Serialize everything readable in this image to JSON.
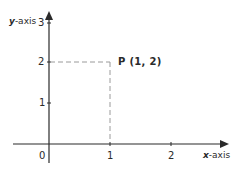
{
  "diagram": {
    "type": "coordinate-plane",
    "x_axis": {
      "var": "x",
      "suffix": "-axis",
      "ticks": [
        "0",
        "1",
        "2"
      ]
    },
    "y_axis": {
      "var": "y",
      "suffix": "-axis",
      "ticks": [
        "1",
        "2",
        "3"
      ]
    },
    "point": {
      "label": "P (1, 2)",
      "x": 1,
      "y": 2
    },
    "colors": {
      "axis": "#2a2a2a",
      "guide": "#9a9a9a"
    }
  }
}
